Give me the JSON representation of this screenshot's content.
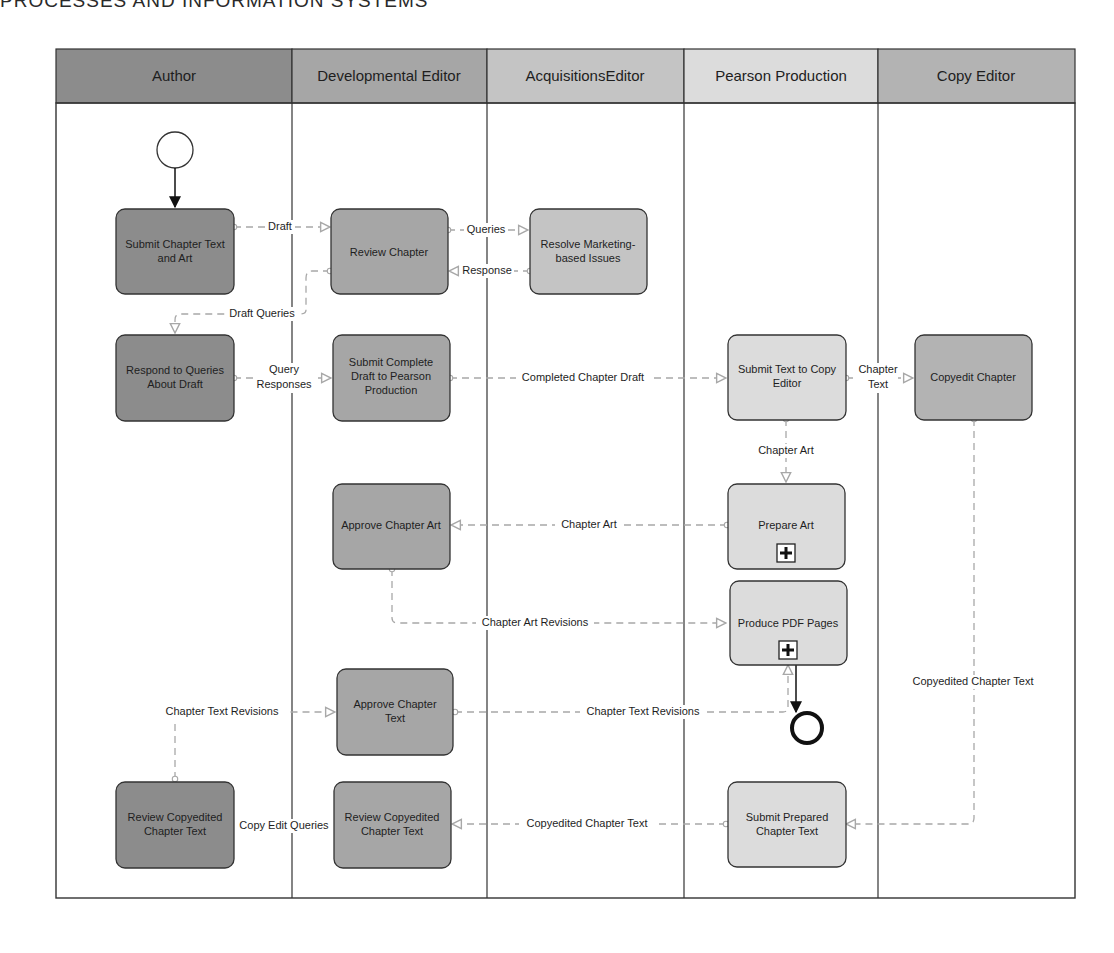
{
  "page": {
    "running_header": "PROCESSES AND INFORMATION SYSTEMS"
  },
  "diagram": {
    "type": "swimlane-process",
    "colors": {
      "author": "#8c8c8c",
      "developmental_editor": "#a6a6a6",
      "acquisitions_editor": "#c4c4c4",
      "pearson_production": "#dcdcdc",
      "copy_editor": "#b3b3b3",
      "flow_line": "#a8a8a8",
      "border": "#333333"
    },
    "lanes": [
      {
        "id": "author",
        "label": "Author"
      },
      {
        "id": "dev",
        "label": "Developmental Editor"
      },
      {
        "id": "acq",
        "label": "AcquisitionsEditor"
      },
      {
        "id": "pp",
        "label": "Pearson Production"
      },
      {
        "id": "ce",
        "label": "Copy Editor"
      }
    ],
    "tasks": {
      "submit_chapter": {
        "lines": [
          "Submit Chapter Text",
          "and Art"
        ]
      },
      "review_chapter": {
        "lines": [
          "Review Chapter"
        ]
      },
      "resolve_marketing": {
        "lines": [
          "Resolve Marketing-",
          "based Issues"
        ]
      },
      "respond_queries": {
        "lines": [
          "Respond to Queries",
          "About Draft"
        ]
      },
      "submit_complete": {
        "lines": [
          "Submit Complete",
          "Draft to Pearson",
          "Production"
        ]
      },
      "submit_text_copy": {
        "lines": [
          "Submit Text to Copy",
          "Editor"
        ]
      },
      "copyedit_chapter": {
        "lines": [
          "Copyedit Chapter"
        ]
      },
      "approve_art": {
        "lines": [
          "Approve Chapter Art"
        ]
      },
      "prepare_art": {
        "lines": [
          "Prepare Art"
        ],
        "subprocess": true
      },
      "produce_pdf": {
        "lines": [
          "Produce PDF Pages"
        ],
        "subprocess": true
      },
      "approve_text": {
        "lines": [
          "Approve Chapter",
          "Text"
        ]
      },
      "review_copyedited_author": {
        "lines": [
          "Review Copyedited",
          "Chapter Text"
        ]
      },
      "review_copyedited_dev": {
        "lines": [
          "Review Copyedited",
          "Chapter Text"
        ]
      },
      "submit_prepared": {
        "lines": [
          "Submit Prepared",
          "Chapter Text"
        ]
      }
    },
    "flows": {
      "draft": "Draft",
      "queries": "Queries",
      "response": "Response",
      "draft_queries": "Draft Queries",
      "query_responses_1": "Query",
      "query_responses_2": "Responses",
      "completed_chapter_draft": "Completed Chapter Draft",
      "chapter_text_1": "Chapter",
      "chapter_text_2": "Text",
      "chapter_art_down": "Chapter Art",
      "chapter_art_left": "Chapter Art",
      "chapter_art_revisions": "Chapter Art Revisions",
      "chapter_text_revisions_left": "Chapter Text Revisions",
      "chapter_text_revisions_right": "Chapter Text Revisions",
      "copyedited_chapter_text_vertical": "Copyedited Chapter Text",
      "copyedited_chapter_text_horizontal": "Copyedited Chapter Text",
      "copy_edit_queries": "Copy Edit Queries"
    },
    "events": {
      "start": "start-event",
      "end": "end-event"
    }
  }
}
